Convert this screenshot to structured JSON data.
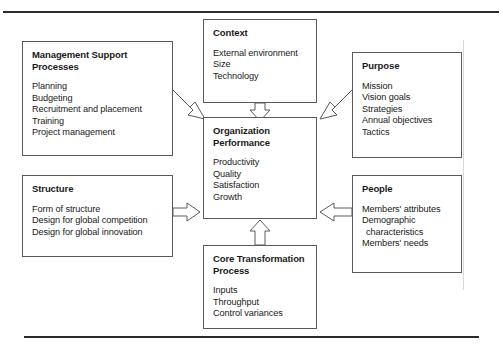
{
  "figure": {
    "type": "systems-model-diagram",
    "boxes": {
      "management_support": {
        "title": "Management Support\nProcesses",
        "items": [
          "Planning",
          "Budgeting",
          "Recruitment and placement",
          "Training",
          "Project management"
        ]
      },
      "context": {
        "title": "Context",
        "items": [
          "External environment",
          "Size",
          "Technology"
        ]
      },
      "purpose": {
        "title": "Purpose",
        "items": [
          "Mission",
          "Vision goals",
          "Strategies",
          "Annual objectives",
          "Tactics"
        ]
      },
      "organization_performance": {
        "title": "Organization\nPerformance",
        "items": [
          "Productivity",
          "Quality",
          "Satisfaction",
          "Growth"
        ]
      },
      "structure": {
        "title": "Structure",
        "items": [
          "Form of structure",
          "Design for global competition",
          "Design for global innovation"
        ]
      },
      "people": {
        "title": "People",
        "items": [
          "Members' attributes",
          "Demographic",
          "characteristics",
          "Members' needs"
        ]
      },
      "core_transformation": {
        "title": "Core Transformation\nProcess",
        "items": [
          "Inputs",
          "Throughput",
          "Control variances"
        ]
      }
    },
    "arrows": [
      {
        "name": "management-to-center",
        "from": "management_support",
        "to": "organization_performance",
        "direction": "down-right"
      },
      {
        "name": "context-to-center",
        "from": "context",
        "to": "organization_performance",
        "direction": "down"
      },
      {
        "name": "purpose-to-center",
        "from": "purpose",
        "to": "organization_performance",
        "direction": "down-left"
      },
      {
        "name": "structure-to-center",
        "from": "structure",
        "to": "organization_performance",
        "direction": "right"
      },
      {
        "name": "people-to-center",
        "from": "people",
        "to": "organization_performance",
        "direction": "left"
      },
      {
        "name": "core-to-center",
        "from": "core_transformation",
        "to": "organization_performance",
        "direction": "up"
      }
    ],
    "colors": {
      "box_border": "#5a5a5a",
      "rule": "#2b2b2b",
      "text": "#1a1a1a",
      "background": "#ffffff"
    }
  }
}
